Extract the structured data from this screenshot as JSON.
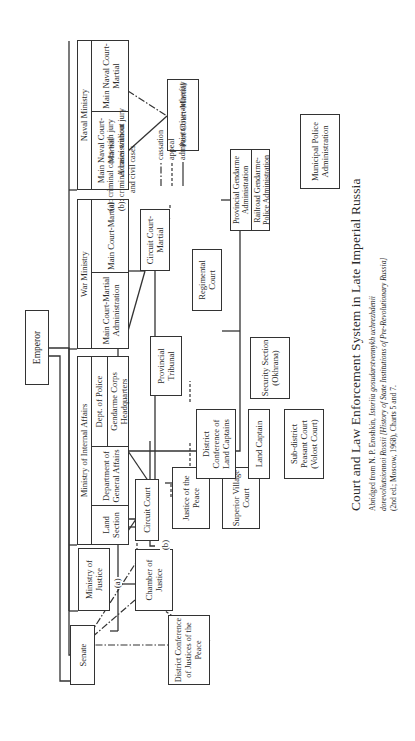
{
  "diagram": {
    "title": "Court and Law Enforcement System in Late Imperial Russia",
    "source": {
      "line1_prefix": "Abridged from N. P. Eroshkin, ",
      "line1_italic": "Istoriia gosudarstvennykh uchrezhdenii",
      "line2_italic": "dorevoliutsionnoi Rossii [History of State Institutions of Pre-Revolutionary Russia]",
      "line3": "(2nd ed.; Moscow, 1968), Charts 5 and 7."
    },
    "nodes": {
      "emperor": "Emperor",
      "senate": "Senate",
      "ministry_of_justice": "Ministry of Justice",
      "internal_affairs": {
        "header": "Ministry of Internal Affairs",
        "land_section": "Land Section",
        "general_affairs": "Department of General Affairs",
        "dept_police": "Dept. of Police",
        "gendarme_hq": "Gendarme Corps Headquarters"
      },
      "war_ministry": {
        "header": "War Ministry",
        "main_admin": "Main Court-Martial Administration",
        "main_court": "Main Court-Martial"
      },
      "naval_ministry": {
        "header": "Naval Ministry",
        "main_admin": "Main Naval Court-Martial Administration",
        "main_court": "Main Naval Court-Martial"
      },
      "chamber_of_justice": "Chamber of Justice",
      "circuit_court": "Circuit Court",
      "justice_of_the_peace": "Justice of the Peace",
      "district_conf_justices": "District Conference of Justices of the Peace",
      "superior_village_court": "Superior Village Court",
      "provincial_tribunal": "Provincial Tribunal",
      "district_conf_land_captains": "District Conference of Land Captains",
      "land_captain": "Land Captain",
      "subdistrict_peasant_court": "Sub-district Peasant Court (Volost Court)",
      "security_section": "Security Section (Okhrana)",
      "provincial_gendarme": "Provincial Gendarme Administration",
      "railroad_gendarme": "Railroad Gendarme-Police Administration",
      "municipal_police": "Municipal Police Administration",
      "circuit_court_martial": "Circuit Court-Martial",
      "regimental_court": "Regimental Court",
      "port_court_martial": "Port Court-Martial"
    },
    "edge_labels": {
      "a": "(a)",
      "b": "(b)"
    },
    "legend": {
      "note_a": "(a): criminal cases with jury",
      "note_b_1": "(b): criminal cases without jury",
      "note_b_2": "and civil cases",
      "cassation": "cassation",
      "appeal": "appeal",
      "administrative": "administrative authority"
    }
  }
}
